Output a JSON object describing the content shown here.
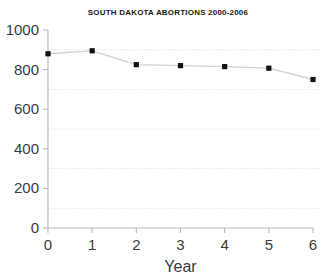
{
  "chart_data": {
    "type": "line",
    "title": "SOUTH DAKOTA ABORTIONS 2000-2006",
    "xlabel": "Year",
    "ylabel": "",
    "x": [
      0,
      1,
      2,
      3,
      4,
      5,
      6
    ],
    "values": [
      880,
      895,
      825,
      820,
      815,
      807,
      750
    ],
    "series": [
      {
        "name": "South Dakota abortions",
        "values": [
          880,
          895,
          825,
          820,
          815,
          807,
          750
        ]
      }
    ],
    "xlim": [
      0,
      6
    ],
    "ylim": [
      0,
      1000
    ],
    "xticks": [
      0,
      1,
      2,
      3,
      4,
      5,
      6
    ],
    "xticklabels": [
      "0",
      "1",
      "2",
      "3",
      "4",
      "5",
      "6"
    ],
    "yticks": [
      0,
      200,
      400,
      600,
      800,
      1000
    ],
    "yticklabels": [
      "0",
      "200",
      "400",
      "600",
      "800",
      "1000"
    ],
    "gridlines_y": [
      100,
      300,
      500,
      700,
      900
    ],
    "grid": true,
    "legend": false,
    "legend_position": "none",
    "marker": "square",
    "line_color": "#d2d2d2",
    "marker_color": "#111111",
    "grid_color": "#e3e3e3",
    "axis_color": "#b9b9b9",
    "background_color": "#ffffff"
  }
}
